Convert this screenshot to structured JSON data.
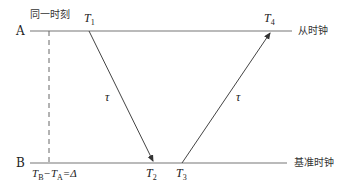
{
  "diagram": {
    "axes": {
      "a": {
        "label": "A",
        "name": "从时钟"
      },
      "b": {
        "label": "B",
        "name": "基准时钟"
      }
    },
    "labels": {
      "same_moment": "同一时刻",
      "t1": "T",
      "t1_sub": "1",
      "t2": "T",
      "t2_sub": "2",
      "t3": "T",
      "t3_sub": "3",
      "t4": "T",
      "t4_sub": "4",
      "tau_left": "τ",
      "tau_right": "τ",
      "offset_eq": "T<sub>B</sub>−T<sub>A</sub>=Δ",
      "offset_parts": {
        "tb": "T",
        "tb_sub": "B",
        "minus": "−",
        "ta": "T",
        "ta_sub": "A",
        "eq": "=Δ"
      }
    },
    "colors": {
      "line": "#6e6e6e",
      "arrow": "#333333"
    }
  }
}
